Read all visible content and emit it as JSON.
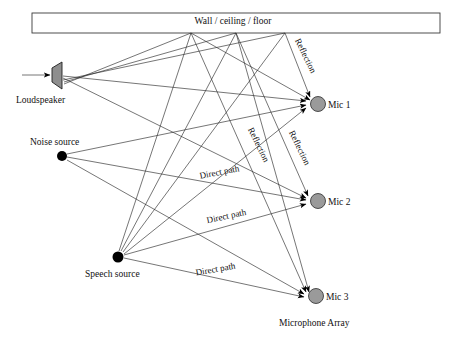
{
  "diagram": {
    "title_label": "Wall / ceiling / floor",
    "source_labels": {
      "loudspeaker": "Loudspeaker",
      "noise_source": "Noise source",
      "speech_source": "Speech source"
    },
    "array_label": "Microphone Array",
    "mics": [
      {
        "label": "Mic 1",
        "cx": 318,
        "cy": 104,
        "r": 7.5
      },
      {
        "label": "Mic 2",
        "cx": 318,
        "cy": 201,
        "r": 7.5
      },
      {
        "label": "Mic 3",
        "cx": 316,
        "cy": 296,
        "r": 7.5
      }
    ],
    "path_labels": [
      {
        "text": "Direct path",
        "x": 220,
        "y": 175,
        "rotate": -11
      },
      {
        "text": "Direct path",
        "x": 227,
        "y": 219,
        "rotate": -12
      },
      {
        "text": "Direct path",
        "x": 216,
        "y": 272,
        "rotate": -10
      }
    ],
    "reflection_labels": [
      {
        "text": "Reflection",
        "x": 303,
        "y": 57,
        "rotate": 64
      },
      {
        "text": "Reflection",
        "x": 256,
        "y": 146,
        "rotate": 64
      },
      {
        "text": "Reflection",
        "x": 297,
        "y": 149,
        "rotate": 64
      }
    ],
    "wall_box": {
      "x": 32,
      "y": 13,
      "w": 408,
      "h": 20
    },
    "reflection_points": [
      {
        "x": 191,
        "y": 33
      },
      {
        "x": 236,
        "y": 33
      },
      {
        "x": 285,
        "y": 33
      }
    ],
    "nodes": {
      "loudspeaker_apex": {
        "x": 62,
        "y": 75
      },
      "noise_source": {
        "x": 62,
        "y": 156
      },
      "speech_source": {
        "x": 118,
        "y": 257
      }
    },
    "colors": {
      "mic_fill": "#9a9a9a",
      "speaker_fill": "#8e8e8e",
      "line": "#2b2b2b",
      "text": "#111111",
      "background": "#ffffff"
    }
  }
}
